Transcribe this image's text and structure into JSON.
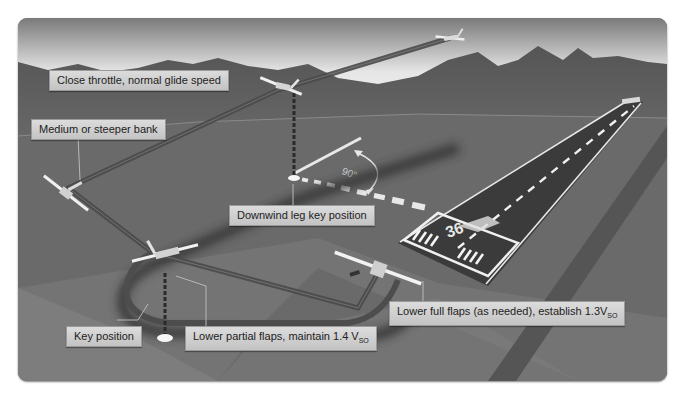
{
  "diagram": {
    "labels": {
      "close_throttle": "Close throttle, normal glide speed",
      "medium_bank": "Medium or steeper bank",
      "downwind_key": "Downwind leg key position",
      "key_position": "Key position",
      "lower_partial": "Lower partial flaps, maintain 1.4 V",
      "lower_partial_sub": "SO",
      "lower_full": "Lower full flaps (as needed), establish 1.3V",
      "lower_full_sub": "SO"
    },
    "angle_marking": "90°",
    "runway_number": "36",
    "colors": {
      "sky_top": "#8a8a8a",
      "sky_bottom": "#f2f2f2",
      "mountains": "#5e5e5e",
      "ground": "#6b6b6b",
      "ground_light": "#808080",
      "runway": "#3c3c3c",
      "label_bg": "#cfcfcf",
      "path": "#4a4a4a"
    }
  }
}
